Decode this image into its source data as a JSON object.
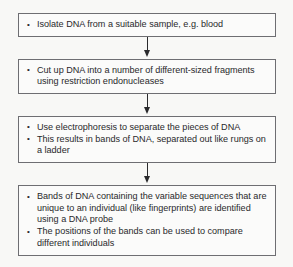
{
  "diagram": {
    "type": "vertical-flowchart",
    "colors": {
      "background": "#f8f8f6",
      "box_fill": "#fbfbfa",
      "box_border": "#6e6e72",
      "text": "#29292b",
      "arrow": "#2a2a2c"
    },
    "steps": [
      {
        "id": "step-1",
        "bullets": [
          "Isolate DNA from a suitable sample, e.g. blood"
        ]
      },
      {
        "id": "step-2",
        "bullets": [
          "Cut up DNA into a number of different-sized fragments using restriction endonucleases"
        ]
      },
      {
        "id": "step-3",
        "bullets": [
          "Use electrophoresis to separate the pieces of DNA",
          "This results in bands of DNA, separated out like rungs on a ladder"
        ]
      },
      {
        "id": "step-4",
        "bullets": [
          "Bands of DNA containing the variable sequences that are unique to an individual (like fingerprints) are identified using a DNA probe",
          "The positions of the bands can be used to compare different individuals"
        ]
      }
    ],
    "connectors": [
      {
        "id": "arrow-1-2",
        "icon": "down-arrow-icon"
      },
      {
        "id": "arrow-2-3",
        "icon": "down-arrow-icon"
      },
      {
        "id": "arrow-3-4",
        "icon": "down-arrow-icon"
      }
    ]
  }
}
